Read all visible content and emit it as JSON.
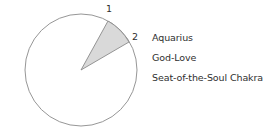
{
  "diagram": {
    "type": "pie-sector",
    "circle": {
      "cx": 81,
      "cy": 70,
      "r": 56,
      "stroke": "#8a8a8a",
      "fill": "#ffffff"
    },
    "sector": {
      "fill": "#d9d9d9",
      "stroke": "#8a8a8a",
      "p1": [
        108,
        21
      ],
      "p2": [
        129,
        42
      ]
    },
    "markers": [
      {
        "label": "1",
        "x": 106,
        "y": 3
      },
      {
        "label": "2",
        "x": 132,
        "y": 31
      }
    ],
    "labels": [
      {
        "text": "Aquarius",
        "x": 152,
        "y": 32
      },
      {
        "text": "God-Love",
        "x": 152,
        "y": 52
      },
      {
        "text": "Seat-of-the-Soul Chakra",
        "x": 152,
        "y": 72
      }
    ]
  }
}
